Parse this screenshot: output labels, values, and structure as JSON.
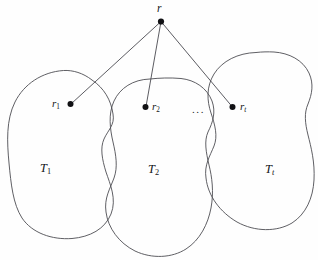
{
  "figure": {
    "kind": "tree-decomposition-diagram",
    "background_color": "#fefefe",
    "stroke_color": "#4d4d52",
    "node_color": "#111114",
    "width": 318,
    "height": 260
  },
  "nodes": {
    "root": {
      "label": "r",
      "x": 161,
      "y": 21
    },
    "child1": {
      "label": "r",
      "sub": "1",
      "x": 70,
      "y": 104
    },
    "child2": {
      "label": "r",
      "sub": "2",
      "x": 145,
      "y": 107
    },
    "childt": {
      "label": "r",
      "sub": "t",
      "x": 233,
      "y": 107
    }
  },
  "subtrees": {
    "first": {
      "label": "T",
      "sub": "1"
    },
    "second": {
      "label": "T",
      "sub": "2"
    },
    "last": {
      "label": "T",
      "sub": "t"
    }
  },
  "ellipsis": {
    "text": "..."
  },
  "edges": [
    {
      "from": "root",
      "to": "child1"
    },
    {
      "from": "root",
      "to": "child2"
    },
    {
      "from": "root",
      "to": "childt"
    }
  ]
}
